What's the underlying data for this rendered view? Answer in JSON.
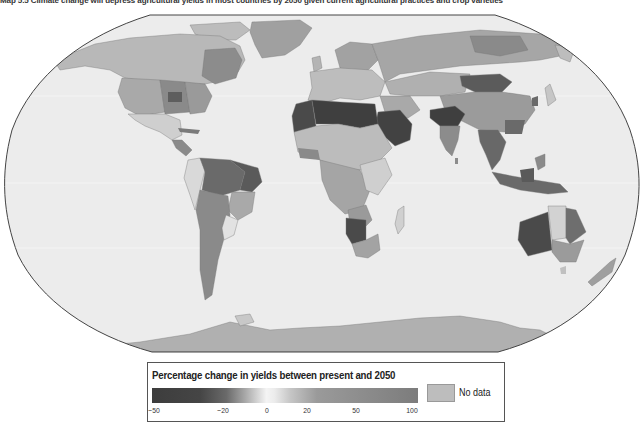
{
  "title": "Map 5.5  Climate change will depress agricultural yields in most countries by 2050 given current agricultural practices and crop varieties",
  "map": {
    "projection": "Robinson",
    "ocean_color": "#ececec",
    "outline_color": "#444444",
    "regions": [
      {
        "name": "Canada",
        "shade": "#b5b5b5"
      },
      {
        "name": "United States (west)",
        "shade": "#a9a9a9"
      },
      {
        "name": "United States (midwest)",
        "shade": "#7a7a7a"
      },
      {
        "name": "United States (east)",
        "shade": "#9a9a9a"
      },
      {
        "name": "Greenland",
        "shade": "#a0a0a0"
      },
      {
        "name": "Mexico",
        "shade": "#cfcfcf"
      },
      {
        "name": "Central America",
        "shade": "#8a8a8a"
      },
      {
        "name": "Brazil (north)",
        "shade": "#6a6a6a"
      },
      {
        "name": "Brazil (northeast)",
        "shade": "#5a5a5a"
      },
      {
        "name": "Andes / Peru",
        "shade": "#d9d9d9"
      },
      {
        "name": "Argentina",
        "shade": "#8a8a8a"
      },
      {
        "name": "Uruguay",
        "shade": "#e2e2e2"
      },
      {
        "name": "Europe",
        "shade": "#bdbdbd"
      },
      {
        "name": "Scandinavia",
        "shade": "#a2a2a2"
      },
      {
        "name": "Russia",
        "shade": "#a6a6a6"
      },
      {
        "name": "North Africa",
        "shade": "#3f3f3f"
      },
      {
        "name": "Western Sahara / Mauritania",
        "shade": "#4a4a4a"
      },
      {
        "name": "Arabian Peninsula",
        "shade": "#424242"
      },
      {
        "name": "Sub-Saharan Africa",
        "shade": "#bcbcbc"
      },
      {
        "name": "Central Africa",
        "shade": "#a5a5a5"
      },
      {
        "name": "Southern Africa (Namibia)",
        "shade": "#4a4a4a"
      },
      {
        "name": "South Africa",
        "shade": "#a3a3a3"
      },
      {
        "name": "Madagascar",
        "shade": "#d0d0d0"
      },
      {
        "name": "India (north)",
        "shade": "#3f3f3f"
      },
      {
        "name": "India (south)",
        "shade": "#8c8c8c"
      },
      {
        "name": "Mongolia",
        "shade": "#5b5b5b"
      },
      {
        "name": "China",
        "shade": "#9b9b9b"
      },
      {
        "name": "Southeast Asia",
        "shade": "#686868"
      },
      {
        "name": "Indonesia",
        "shade": "#6a6a6a"
      },
      {
        "name": "Australia (west)",
        "shade": "#4a4a4a"
      },
      {
        "name": "Australia (central)",
        "shade": "#d2d2d2"
      },
      {
        "name": "Australia (east)",
        "shade": "#6e6e6e"
      },
      {
        "name": "Australia (southeast)",
        "shade": "#9b9b9b"
      },
      {
        "name": "New Zealand",
        "shade": "#9f9f9f"
      },
      {
        "name": "Antarctica",
        "shade": "#b0b0b0"
      }
    ]
  },
  "legend": {
    "title": "Percentage change in yields between present and 2050",
    "ticks": [
      {
        "label": "−50",
        "pos": 4
      },
      {
        "label": "−20",
        "pos": 74
      },
      {
        "label": "0",
        "pos": 119
      },
      {
        "label": "20",
        "pos": 159
      },
      {
        "label": "50",
        "pos": 208
      },
      {
        "label": "100",
        "pos": 264
      }
    ],
    "no_data_label": "No data",
    "no_data_color": "#bdbdbd"
  }
}
